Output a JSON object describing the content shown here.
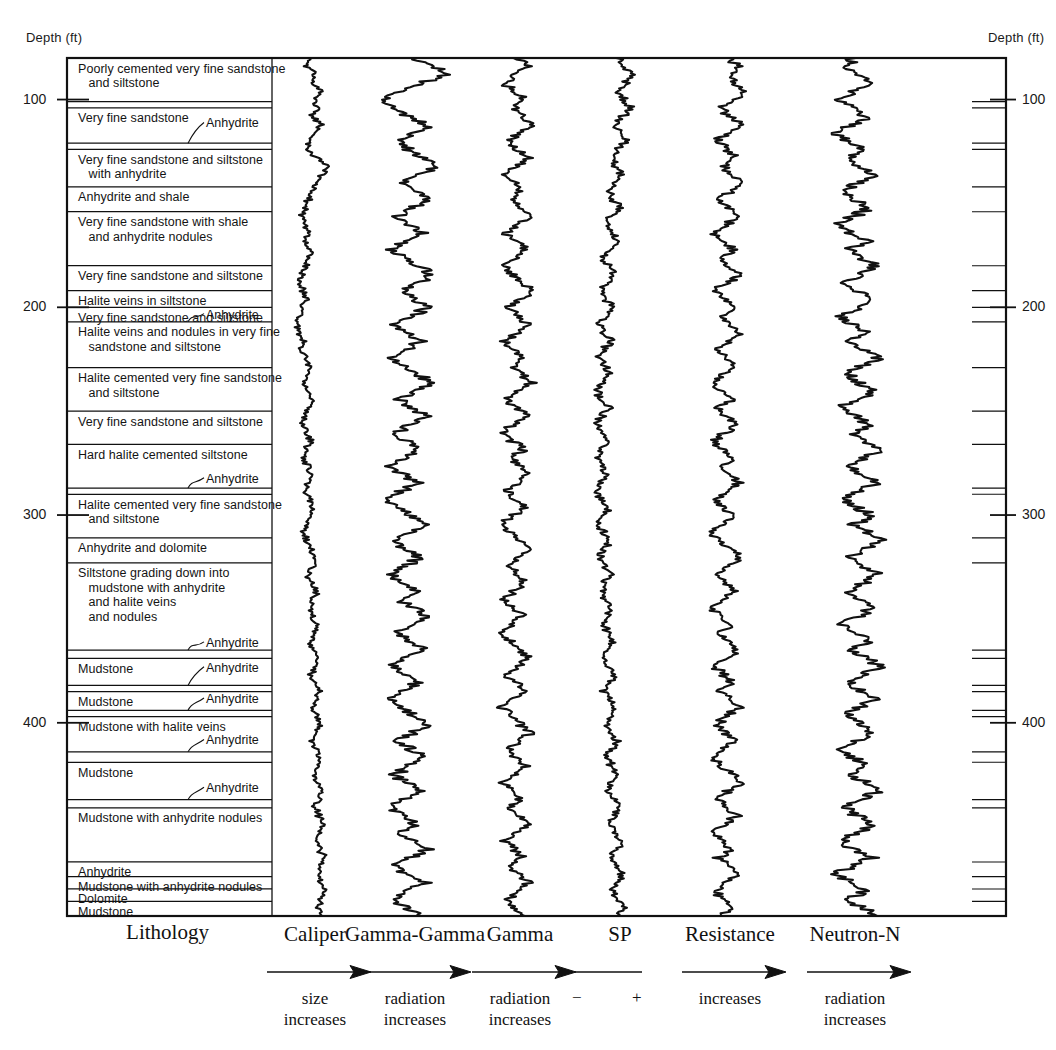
{
  "figure": {
    "type": "well-log-lithology-column",
    "depth_axis": {
      "label_left": "Depth (ft)",
      "label_right": "Depth (ft)",
      "units": "ft",
      "ticks": [
        100,
        200,
        300,
        400
      ],
      "top_depth": 80,
      "bottom_depth": 480
    }
  },
  "lithology": {
    "header": "Lithology",
    "units": [
      {
        "text": "Poorly cemented very fine sandstone\n   and siltstone",
        "top": 80,
        "bottom": 101
      },
      {
        "text": "",
        "top": 101,
        "bottom": 104
      },
      {
        "text": "Very fine sandstone",
        "top": 104,
        "bottom": 121
      },
      {
        "text": "",
        "top": 121,
        "bottom": 124
      },
      {
        "text": "Very fine sandstone and siltstone\n   with anhydrite",
        "top": 124,
        "bottom": 142
      },
      {
        "text": "Anhydrite and shale",
        "top": 142,
        "bottom": 154
      },
      {
        "text": "Very fine sandstone with shale\n   and anhydrite nodules",
        "top": 154,
        "bottom": 180
      },
      {
        "text": "Very fine sandstone and siltstone",
        "top": 180,
        "bottom": 192
      },
      {
        "text": "Halite veins in siltstone",
        "top": 192,
        "bottom": 200
      },
      {
        "text": "Very fine sandstone and siltstone",
        "top": 200,
        "bottom": 207
      },
      {
        "text": "Halite veins and nodules in very fine\n   sandstone and siltstone",
        "top": 207,
        "bottom": 229
      },
      {
        "text": "Halite cemented very fine sandstone\n   and siltstone",
        "top": 229,
        "bottom": 250
      },
      {
        "text": "Very fine sandstone and siltstone",
        "top": 250,
        "bottom": 266
      },
      {
        "text": "Hard halite cemented siltstone",
        "top": 266,
        "bottom": 287
      },
      {
        "text": "",
        "top": 287,
        "bottom": 290
      },
      {
        "text": "Halite cemented very fine sandstone\n   and siltstone",
        "top": 290,
        "bottom": 311
      },
      {
        "text": "Anhydrite and dolomite",
        "top": 311,
        "bottom": 323
      },
      {
        "text": "Siltstone grading down into\n   mudstone with anhydrite\n   and halite veins\n   and nodules",
        "top": 323,
        "bottom": 365
      },
      {
        "text": "",
        "top": 365,
        "bottom": 369
      },
      {
        "text": "Mudstone",
        "top": 369,
        "bottom": 382
      },
      {
        "text": "",
        "top": 382,
        "bottom": 385
      },
      {
        "text": "Mudstone",
        "top": 385,
        "bottom": 394
      },
      {
        "text": "",
        "top": 394,
        "bottom": 397
      },
      {
        "text": "Mudstone with halite veins",
        "top": 397,
        "bottom": 414
      },
      {
        "text": "",
        "top": 414,
        "bottom": 419
      },
      {
        "text": "Mudstone",
        "top": 419,
        "bottom": 437
      },
      {
        "text": "",
        "top": 437,
        "bottom": 441
      },
      {
        "text": "Mudstone with anhydrite nodules",
        "top": 441,
        "bottom": 467
      },
      {
        "text": "Anhydrite",
        "top": 467,
        "bottom": 474
      },
      {
        "text": "Mudstone with anhydrite nodules",
        "top": 474,
        "bottom": 480
      },
      {
        "text": "Dolomite",
        "top": 480,
        "bottom": 486
      },
      {
        "text": "Mudstone",
        "top": 486,
        "bottom": 493
      }
    ],
    "anhydrite_callouts": [
      {
        "label": "Anhydrite",
        "depth": 112
      },
      {
        "label": "Anhydrite",
        "depth": 204
      },
      {
        "label": "Anhydrite",
        "depth": 283
      },
      {
        "label": "Anhydrite",
        "depth": 362
      },
      {
        "label": "Anhydrite",
        "depth": 374
      },
      {
        "label": "Anhydrite",
        "depth": 389
      },
      {
        "label": "Anhydrite",
        "depth": 409
      },
      {
        "label": "Anhydrite",
        "depth": 432
      }
    ]
  },
  "tracks": [
    {
      "name": "caliper",
      "title": "Caliper",
      "arrow": true,
      "sub": "size\nincreases"
    },
    {
      "name": "gamma-gamma",
      "title": "Gamma-Gamma",
      "arrow": true,
      "sub": "radiation\nincreases"
    },
    {
      "name": "gamma",
      "title": "Gamma",
      "arrow": true,
      "sub": "radiation\nincreases"
    },
    {
      "name": "sp",
      "title": "SP",
      "arrow": false,
      "sub": "",
      "minus": "−",
      "plus": "+"
    },
    {
      "name": "resistance",
      "title": "Resistance",
      "arrow": true,
      "sub": "increases"
    },
    {
      "name": "neutron-n",
      "title": "Neutron-N",
      "arrow": true,
      "sub": "radiation\nincreases"
    }
  ],
  "chart_data": {
    "type": "line",
    "orientation": "vertical-depth",
    "title": "",
    "xlabel": "",
    "ylabel": "Depth (ft)",
    "ylim": [
      80,
      493
    ],
    "grid": false,
    "legend": "bottom",
    "series": [
      {
        "name": "Caliper",
        "units": "relative size",
        "x_center_px": 315,
        "half_width_px": 25,
        "values": [
          0.42,
          0.3,
          0.52,
          0.46,
          0.6,
          0.48,
          0.55,
          0.44,
          0.62,
          0.5,
          0.4,
          0.34,
          0.55,
          0.78,
          0.66,
          0.52,
          0.44,
          0.38,
          0.3,
          0.22,
          0.28,
          0.38,
          0.3,
          0.42,
          0.36,
          0.3,
          0.24,
          0.18,
          0.26,
          0.34,
          0.26,
          0.18,
          0.12,
          0.2,
          0.28,
          0.22,
          0.3,
          0.4,
          0.34,
          0.28,
          0.36,
          0.44,
          0.38,
          0.3,
          0.24,
          0.32,
          0.4,
          0.34,
          0.26,
          0.34,
          0.42,
          0.36,
          0.3,
          0.38,
          0.46,
          0.4,
          0.32,
          0.26,
          0.34,
          0.42,
          0.5,
          0.44,
          0.36,
          0.44,
          0.52,
          0.46,
          0.38,
          0.46,
          0.54,
          0.48,
          0.4,
          0.48,
          0.56,
          0.5,
          0.42,
          0.5,
          0.58,
          0.52,
          0.44,
          0.52,
          0.6,
          0.54,
          0.46,
          0.54,
          0.62,
          0.56,
          0.48,
          0.56,
          0.64,
          0.58,
          0.5,
          0.58,
          0.66,
          0.6,
          0.52,
          0.6,
          0.68,
          0.62,
          0.54,
          0.62,
          0.7,
          0.64,
          0.56,
          0.64
        ]
      },
      {
        "name": "Gamma-Gamma",
        "units": "relative radiation",
        "x_center_px": 415,
        "half_width_px": 52,
        "values": [
          0.5,
          0.66,
          0.8,
          0.58,
          0.36,
          0.2,
          0.3,
          0.46,
          0.62,
          0.5,
          0.34,
          0.44,
          0.58,
          0.7,
          0.54,
          0.38,
          0.5,
          0.64,
          0.48,
          0.32,
          0.44,
          0.58,
          0.42,
          0.28,
          0.4,
          0.54,
          0.68,
          0.52,
          0.36,
          0.48,
          0.62,
          0.46,
          0.3,
          0.42,
          0.56,
          0.4,
          0.26,
          0.38,
          0.52,
          0.66,
          0.5,
          0.34,
          0.46,
          0.6,
          0.44,
          0.3,
          0.42,
          0.56,
          0.4,
          0.26,
          0.38,
          0.52,
          0.36,
          0.22,
          0.34,
          0.48,
          0.62,
          0.46,
          0.3,
          0.42,
          0.56,
          0.4,
          0.26,
          0.38,
          0.52,
          0.36,
          0.48,
          0.62,
          0.46,
          0.32,
          0.44,
          0.58,
          0.42,
          0.28,
          0.4,
          0.54,
          0.38,
          0.24,
          0.36,
          0.5,
          0.64,
          0.48,
          0.34,
          0.46,
          0.6,
          0.44,
          0.3,
          0.42,
          0.56,
          0.4,
          0.26,
          0.38,
          0.52,
          0.36,
          0.48,
          0.62,
          0.46,
          0.32,
          0.44,
          0.58,
          0.42,
          0.28,
          0.4,
          0.54
        ]
      },
      {
        "name": "Gamma",
        "units": "relative radiation",
        "x_center_px": 520,
        "half_width_px": 38,
        "values": [
          0.48,
          0.6,
          0.44,
          0.3,
          0.42,
          0.56,
          0.4,
          0.52,
          0.66,
          0.5,
          0.34,
          0.46,
          0.6,
          0.44,
          0.3,
          0.42,
          0.54,
          0.38,
          0.5,
          0.64,
          0.48,
          0.32,
          0.44,
          0.58,
          0.42,
          0.28,
          0.4,
          0.52,
          0.66,
          0.5,
          0.36,
          0.48,
          0.62,
          0.46,
          0.3,
          0.42,
          0.56,
          0.4,
          0.52,
          0.64,
          0.48,
          0.34,
          0.46,
          0.58,
          0.42,
          0.28,
          0.4,
          0.54,
          0.38,
          0.5,
          0.62,
          0.46,
          0.32,
          0.44,
          0.56,
          0.4,
          0.26,
          0.38,
          0.5,
          0.64,
          0.48,
          0.34,
          0.46,
          0.58,
          0.42,
          0.3,
          0.42,
          0.54,
          0.38,
          0.24,
          0.36,
          0.48,
          0.62,
          0.46,
          0.32,
          0.44,
          0.56,
          0.4,
          0.26,
          0.38,
          0.5,
          0.64,
          0.48,
          0.34,
          0.46,
          0.58,
          0.42,
          0.28,
          0.4,
          0.52,
          0.36,
          0.48,
          0.6,
          0.44,
          0.3,
          0.42,
          0.54,
          0.38,
          0.5,
          0.62,
          0.46,
          0.32,
          0.44,
          0.56
        ]
      },
      {
        "name": "SP",
        "units": "millivolts (relative)",
        "x_center_px": 620,
        "half_width_px": 32,
        "values": [
          0.46,
          0.58,
          0.7,
          0.6,
          0.48,
          0.56,
          0.66,
          0.54,
          0.42,
          0.5,
          0.6,
          0.48,
          0.36,
          0.44,
          0.54,
          0.42,
          0.32,
          0.4,
          0.5,
          0.38,
          0.28,
          0.36,
          0.46,
          0.34,
          0.24,
          0.32,
          0.42,
          0.3,
          0.2,
          0.28,
          0.38,
          0.26,
          0.18,
          0.26,
          0.36,
          0.24,
          0.16,
          0.24,
          0.34,
          0.22,
          0.14,
          0.22,
          0.32,
          0.2,
          0.14,
          0.22,
          0.3,
          0.2,
          0.14,
          0.22,
          0.3,
          0.2,
          0.14,
          0.22,
          0.32,
          0.22,
          0.16,
          0.24,
          0.34,
          0.24,
          0.18,
          0.26,
          0.36,
          0.26,
          0.2,
          0.28,
          0.38,
          0.28,
          0.22,
          0.3,
          0.4,
          0.3,
          0.24,
          0.32,
          0.42,
          0.32,
          0.26,
          0.34,
          0.44,
          0.34,
          0.28,
          0.36,
          0.46,
          0.36,
          0.3,
          0.38,
          0.48,
          0.38,
          0.32,
          0.4,
          0.5,
          0.4,
          0.34,
          0.42,
          0.52,
          0.42,
          0.36,
          0.44,
          0.54,
          0.44,
          0.38,
          0.46,
          0.56,
          0.46
        ]
      },
      {
        "name": "Resistance",
        "units": "ohm-m (relative)",
        "x_center_px": 730,
        "half_width_px": 40,
        "values": [
          0.5,
          0.62,
          0.46,
          0.58,
          0.7,
          0.54,
          0.38,
          0.5,
          0.64,
          0.48,
          0.34,
          0.46,
          0.58,
          0.42,
          0.54,
          0.66,
          0.5,
          0.36,
          0.48,
          0.6,
          0.44,
          0.3,
          0.42,
          0.54,
          0.38,
          0.5,
          0.62,
          0.46,
          0.32,
          0.44,
          0.56,
          0.4,
          0.52,
          0.64,
          0.48,
          0.34,
          0.46,
          0.58,
          0.42,
          0.28,
          0.4,
          0.52,
          0.36,
          0.48,
          0.6,
          0.44,
          0.3,
          0.42,
          0.54,
          0.38,
          0.5,
          0.62,
          0.46,
          0.32,
          0.44,
          0.56,
          0.4,
          0.26,
          0.38,
          0.5,
          0.64,
          0.48,
          0.34,
          0.46,
          0.58,
          0.42,
          0.28,
          0.4,
          0.52,
          0.36,
          0.48,
          0.6,
          0.44,
          0.3,
          0.42,
          0.54,
          0.38,
          0.5,
          0.62,
          0.46,
          0.32,
          0.44,
          0.56,
          0.4,
          0.26,
          0.38,
          0.5,
          0.64,
          0.48,
          0.34,
          0.46,
          0.58,
          0.42,
          0.28,
          0.4,
          0.52,
          0.36,
          0.48,
          0.6,
          0.44,
          0.3,
          0.42,
          0.54,
          0.38
        ]
      },
      {
        "name": "Neutron-N",
        "units": "relative radiation",
        "x_center_px": 855,
        "half_width_px": 55,
        "values": [
          0.52,
          0.4,
          0.54,
          0.68,
          0.5,
          0.36,
          0.48,
          0.62,
          0.46,
          0.32,
          0.44,
          0.58,
          0.42,
          0.54,
          0.68,
          0.52,
          0.38,
          0.5,
          0.64,
          0.48,
          0.34,
          0.46,
          0.6,
          0.44,
          0.56,
          0.7,
          0.54,
          0.4,
          0.52,
          0.66,
          0.5,
          0.36,
          0.48,
          0.62,
          0.46,
          0.58,
          0.72,
          0.56,
          0.42,
          0.54,
          0.68,
          0.52,
          0.38,
          0.5,
          0.64,
          0.48,
          0.6,
          0.74,
          0.58,
          0.44,
          0.56,
          0.7,
          0.54,
          0.4,
          0.52,
          0.66,
          0.5,
          0.62,
          0.76,
          0.6,
          0.46,
          0.58,
          0.72,
          0.56,
          0.42,
          0.54,
          0.68,
          0.52,
          0.38,
          0.5,
          0.64,
          0.48,
          0.6,
          0.74,
          0.58,
          0.44,
          0.56,
          0.7,
          0.54,
          0.4,
          0.52,
          0.66,
          0.5,
          0.36,
          0.48,
          0.62,
          0.46,
          0.58,
          0.72,
          0.56,
          0.42,
          0.54,
          0.68,
          0.52,
          0.38,
          0.5,
          0.64,
          0.48,
          0.34,
          0.46,
          0.6,
          0.44,
          0.56,
          0.7
        ]
      }
    ]
  },
  "colors": {
    "ink": "#111111",
    "background": "#ffffff"
  }
}
